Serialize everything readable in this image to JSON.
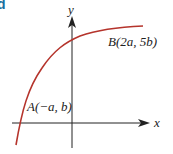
{
  "corner_letter": "d",
  "axes": {
    "x_label": "x",
    "y_label": "y"
  },
  "points": {
    "A": {
      "label": "A(−a, b)",
      "name": "A",
      "coords": "(−a, b)"
    },
    "B": {
      "label": "B(2a, 5b)",
      "name": "B",
      "coords": "(2a, 5b)"
    }
  },
  "colors": {
    "curve": "#b5342c",
    "axes": "#222222",
    "corner_letter": "#1a6fa0"
  }
}
